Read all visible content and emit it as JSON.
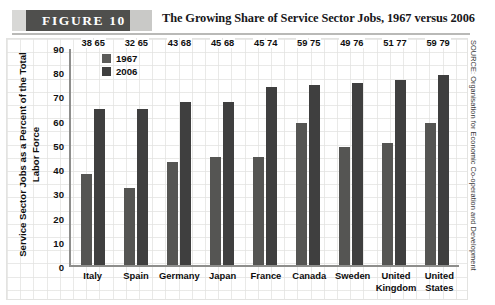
{
  "figure": {
    "banner_label": "FIGURE  10",
    "title": "The Growing Share of Service Sector Jobs, 1967 versus 2006",
    "source": "SOURCE: Organisation for Economic Co-operation and Development"
  },
  "chart_data": {
    "type": "bar",
    "title": "The Growing Share of Service Sector Jobs, 1967 versus 2006",
    "xlabel": "",
    "ylabel": "Service Sector Jobs as a Percent of the Total Labor Force",
    "ylim": [
      0,
      90
    ],
    "yticks": [
      90,
      80,
      70,
      60,
      50,
      40,
      30,
      20,
      10,
      0
    ],
    "grid": true,
    "legend_position": "top-left",
    "categories": [
      "Italy",
      "Spain",
      "Germany",
      "Japan",
      "France",
      "Canada",
      "Sweden",
      "United Kingdom",
      "United States"
    ],
    "series": [
      {
        "name": "1967",
        "color": "#555553",
        "values": [
          38,
          32,
          43,
          45,
          45,
          59,
          49,
          51,
          59
        ]
      },
      {
        "name": "2006",
        "color": "#3f3f3f",
        "values": [
          65,
          65,
          68,
          68,
          74,
          75,
          76,
          77,
          79
        ]
      }
    ]
  }
}
